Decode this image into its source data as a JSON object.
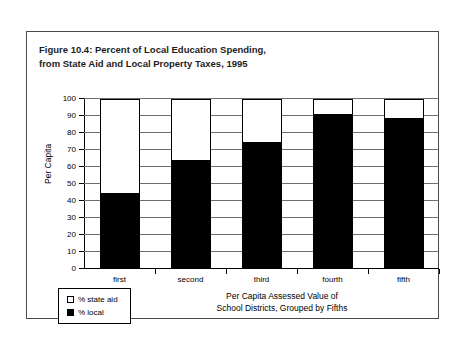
{
  "figure": {
    "title_line1": "Figure 10.4: Percent of Local Education Spending,",
    "title_line2": "from State Aid and Local Property Taxes, 1995"
  },
  "legend": {
    "items": [
      {
        "label": "% state aid",
        "swatch": "hollow-square-icon",
        "color": "#ffffff"
      },
      {
        "label": "% local",
        "swatch": "filled-square-icon",
        "color": "#000000"
      }
    ]
  },
  "axis": {
    "y_title": "Per Capita",
    "x_title_line1": "Per Capita Assessed Value of",
    "x_title_line2": "School Districts, Grouped by Fifths",
    "y_ticks": [
      "0",
      "10",
      "20",
      "30",
      "40",
      "50",
      "60",
      "70",
      "80",
      "90",
      "100"
    ]
  },
  "chart_data": {
    "type": "bar",
    "stacked": true,
    "title": "Figure 10.4: Percent of Local Education Spending, from State Aid and Local Property Taxes, 1995",
    "xlabel": "Per Capita Assessed Value of School Districts, Grouped by Fifths",
    "ylabel": "Per Capita",
    "ylim": [
      0,
      100
    ],
    "ytick_step": 10,
    "grid": true,
    "legend_position": "bottom-left",
    "categories": [
      "first",
      "second",
      "third",
      "fourth",
      "fifth"
    ],
    "series": [
      {
        "name": "% local",
        "color": "#000000",
        "values": [
          45,
          64,
          75,
          91,
          89
        ]
      },
      {
        "name": "% state aid",
        "color": "#ffffff",
        "values": [
          55,
          36,
          25,
          9,
          11
        ]
      }
    ]
  }
}
